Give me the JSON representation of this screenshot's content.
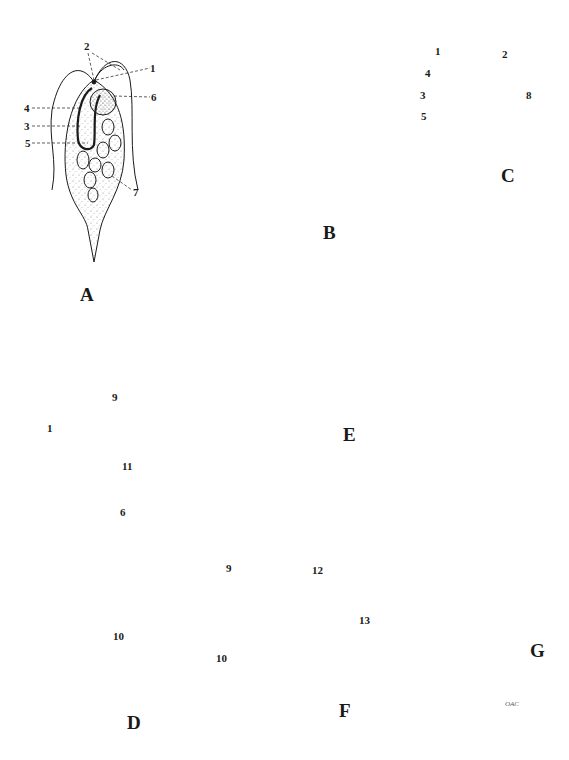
{
  "figure": {
    "header_fragment": "",
    "signature": "OAC",
    "panels": [
      {
        "id": "A",
        "label": "A",
        "callouts": [
          "1",
          "2",
          "3",
          "4",
          "5",
          "6",
          "7"
        ]
      },
      {
        "id": "B",
        "label": "B",
        "callouts": []
      },
      {
        "id": "C",
        "label": "C",
        "callouts": [
          "1",
          "2",
          "3",
          "4",
          "5",
          "8"
        ]
      },
      {
        "id": "D",
        "label": "D",
        "callouts": [
          "1",
          "6",
          "9",
          "10",
          "11"
        ]
      },
      {
        "id": "E",
        "label": "E",
        "callouts": []
      },
      {
        "id": "F",
        "label": "F",
        "callouts": [
          "9",
          "10",
          "12",
          "13"
        ]
      },
      {
        "id": "G",
        "label": "G",
        "callouts": []
      }
    ]
  },
  "colors": {
    "ink": "#1a1a1a",
    "stipple": "#8a8a8a",
    "background": "#ffffff"
  }
}
